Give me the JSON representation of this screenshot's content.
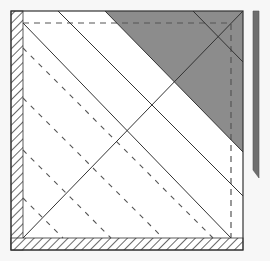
{
  "diagram": {
    "type": "geometric-construction",
    "colors": {
      "background": "#f7f7f7",
      "square_fill": "#ffffff",
      "stroke": "#333333",
      "shaded_triangle": "#8c8c8c",
      "side_bar": "#6e6e6e",
      "dashed": "#555555"
    },
    "outer_square": {
      "x1": 11,
      "y1": 11,
      "x2": 243,
      "y2": 250
    },
    "hatched_strips": [
      {
        "name": "left",
        "x": 11,
        "y": 11,
        "w": 12,
        "h": 239
      },
      {
        "name": "bottom",
        "x": 11,
        "y": 238,
        "w": 232,
        "h": 12
      }
    ],
    "dashed_rectangle": {
      "x1": 23,
      "y1": 23,
      "x2": 231,
      "y2": 238
    },
    "shaded_triangle": [
      [
        105,
        11
      ],
      [
        243,
        11
      ],
      [
        243,
        152
      ]
    ],
    "side_bar": {
      "points": [
        [
          253,
          11
        ],
        [
          259,
          11
        ],
        [
          259,
          178
        ],
        [
          253,
          170
        ]
      ]
    },
    "solid_lines": [
      [
        23,
        23,
        231,
        238
      ],
      [
        58,
        11,
        243,
        196
      ],
      [
        105,
        11,
        243,
        152
      ],
      [
        193,
        11,
        243,
        62
      ],
      [
        23,
        238,
        243,
        11
      ]
    ],
    "dashed_lines": [
      [
        23,
        48,
        213,
        238
      ],
      [
        23,
        98,
        163,
        238
      ],
      [
        23,
        150,
        111,
        238
      ],
      [
        23,
        198,
        63,
        238
      ]
    ]
  }
}
